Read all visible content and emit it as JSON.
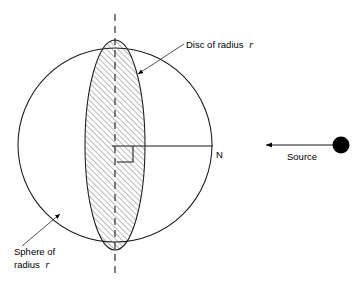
{
  "figure": {
    "title": "",
    "background_color": "#ffffff",
    "stroke_color": "#000000",
    "hatch_color": "#555555",
    "width": 359,
    "height": 288
  },
  "labels": {
    "disc": {
      "text": "Disc of radius",
      "symbol": "r",
      "x": 186,
      "y": 48
    },
    "sphere": {
      "line1": "Sphere of",
      "line2_prefix": "radius",
      "line2_symbol": "r",
      "x": 14,
      "y1": 255,
      "y2": 268
    },
    "north_pole": {
      "text": "N",
      "x": 216,
      "y": 158
    },
    "source": {
      "text": "Source",
      "x": 287,
      "y": 160
    }
  },
  "shapes": {
    "sphere": {
      "name": "Sphere of radius r",
      "center_x": 115,
      "center_y": 145,
      "radius": 97,
      "fill": "none",
      "stroke": "#000000"
    },
    "disc": {
      "name": "Disc of radius r",
      "center_x": 115,
      "center_y": 145,
      "semi_x": 30,
      "semi_y": 105,
      "fill": "hatched",
      "stroke": "#000000"
    },
    "rotation_axis": {
      "name": "vertical dashed axis",
      "x": 115,
      "y_top": 14,
      "y_bottom": 277,
      "style": "dashed"
    },
    "normal_axis": {
      "name": "horizontal axis to N",
      "y": 146,
      "x_start": 115,
      "x_end": 213
    },
    "right_angle_marker": {
      "x": 117,
      "y": 146,
      "size": 16
    },
    "source_marker": {
      "center_x": 341,
      "center_y": 145,
      "radius": 8,
      "fill": "#000000"
    },
    "source_ray": {
      "y": 145,
      "x_start": 333,
      "x_end": 265,
      "direction": "left"
    },
    "disc_leader": {
      "from_x": 184,
      "from_y": 44,
      "to_x": 136,
      "to_y": 75
    },
    "sphere_leader": {
      "from_x": 22,
      "from_y": 246,
      "to_x": 62,
      "to_y": 212
    }
  }
}
